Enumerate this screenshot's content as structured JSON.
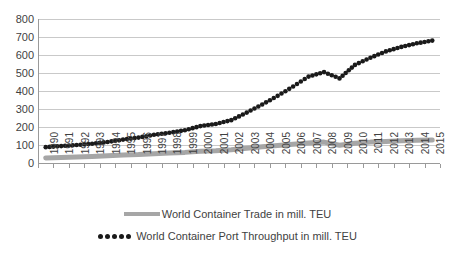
{
  "chart_data": {
    "type": "line",
    "title": "",
    "xlabel": "",
    "ylabel": "",
    "ylim": [
      0,
      800
    ],
    "ytick_step": 100,
    "yticks": [
      "800",
      "700",
      "600",
      "500",
      "400",
      "300",
      "200",
      "100",
      "0"
    ],
    "grid": true,
    "legend_position": "bottom",
    "categories": [
      "1990",
      "1991",
      "1992",
      "1993",
      "1994",
      "1995",
      "1996",
      "1997",
      "1998",
      "1999",
      "2000",
      "2001",
      "2002",
      "2003",
      "2004",
      "2005",
      "2006",
      "2007",
      "2008",
      "2009",
      "2010",
      "2011",
      "2012",
      "2013",
      "2014",
      "2015"
    ],
    "series": [
      {
        "name": "World Container Trade in mill. TEU",
        "marker": "line",
        "color": "#a6a6a6",
        "values": [
          28,
          30,
          33,
          36,
          40,
          44,
          47,
          52,
          55,
          59,
          65,
          68,
          74,
          82,
          90,
          97,
          104,
          111,
          116,
          99,
          110,
          116,
          120,
          124,
          127,
          128
        ]
      },
      {
        "name": "World Container Port Throughput in mill. TEU",
        "marker": "dotted",
        "color": "#1a1a1a",
        "values": [
          88,
          94,
          100,
          107,
          117,
          130,
          141,
          157,
          168,
          182,
          205,
          217,
          238,
          280,
          325,
          373,
          425,
          480,
          505,
          470,
          545,
          585,
          620,
          645,
          665,
          680
        ]
      }
    ]
  },
  "legend": {
    "items": [
      {
        "label": "World Container Trade in mill. TEU",
        "marker": "gray-line-marker"
      },
      {
        "label": "World Container Port Throughput in mill. TEU",
        "marker": "black-dots-marker"
      }
    ]
  }
}
